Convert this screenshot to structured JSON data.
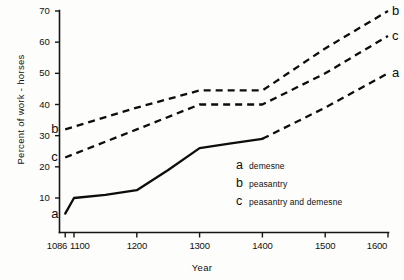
{
  "chart_data": {
    "type": "line",
    "title": "",
    "xlabel": "Year",
    "ylabel": "Percent of work - horses",
    "xlim": [
      1086,
      1600
    ],
    "ylim": [
      0,
      70
    ],
    "grid": false,
    "legend_position": "inside-lower-right",
    "xticks": [
      {
        "value": 1086,
        "label": "1086"
      },
      {
        "value": 1100,
        "label": "1100"
      },
      {
        "value": 1200,
        "label": "1200"
      },
      {
        "value": 1300,
        "label": "1300"
      },
      {
        "value": 1400,
        "label": "1400"
      },
      {
        "value": 1500,
        "label": "1500"
      },
      {
        "value": 1600,
        "label": "1600"
      }
    ],
    "yticks": [
      {
        "value": 10,
        "label": "10"
      },
      {
        "value": 20,
        "label": "20"
      },
      {
        "value": 30,
        "label": "30"
      },
      {
        "value": 40,
        "label": "40"
      },
      {
        "value": 50,
        "label": "50"
      },
      {
        "value": 60,
        "label": "60"
      },
      {
        "value": 70,
        "label": "70"
      }
    ],
    "series": [
      {
        "key": "a",
        "name": "demesne",
        "style": "solid-then-dashed",
        "x": [
          1086,
          1100,
          1150,
          1200,
          1250,
          1300,
          1350,
          1400,
          1500,
          1600
        ],
        "values": [
          5,
          10,
          11,
          12.5,
          19,
          26,
          27.5,
          29,
          39,
          50
        ],
        "solid_until": 1400,
        "label_start": "a",
        "label_end": "a"
      },
      {
        "key": "b",
        "name": "peasantry",
        "style": "dashed",
        "x": [
          1086,
          1200,
          1300,
          1400,
          1500,
          1600
        ],
        "values": [
          32,
          39,
          44.5,
          44.5,
          58,
          70
        ],
        "label_start": "b",
        "label_end": "b"
      },
      {
        "key": "c",
        "name": "peasantry and demesne",
        "style": "dashed",
        "x": [
          1086,
          1200,
          1300,
          1400,
          1500,
          1600
        ],
        "values": [
          23,
          32,
          40,
          40,
          50,
          62
        ],
        "label_start": "c",
        "label_end": "c"
      }
    ],
    "legend": [
      {
        "key": "a",
        "text": "demesne"
      },
      {
        "key": "b",
        "text": "peasantry"
      },
      {
        "key": "c",
        "text": "peasantry and demesne"
      }
    ],
    "colors": {
      "line": "#0d0d0d",
      "axis": "#161616",
      "background": "#fdfdfb"
    }
  }
}
